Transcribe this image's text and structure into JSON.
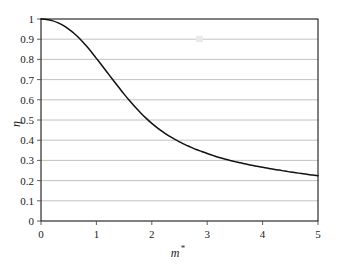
{
  "chart_data": {
    "type": "line",
    "title": "",
    "xlabel": "m*",
    "xlabel_base": "m",
    "xlabel_sup": "*",
    "ylabel": "η",
    "xlim": [
      0,
      5
    ],
    "ylim": [
      0,
      1
    ],
    "grid": "horizontal",
    "legend": "none",
    "xticks": [
      "0",
      "1",
      "2",
      "3",
      "4",
      "5"
    ],
    "xtick_values": [
      0,
      1,
      2,
      3,
      4,
      5
    ],
    "yticks": [
      "0",
      "0.1",
      "0.2",
      "0.3",
      "0.4",
      "0.5",
      "0.6",
      "0.7",
      "0.8",
      "0.9",
      "1"
    ],
    "ytick_values": [
      0,
      0.1,
      0.2,
      0.3,
      0.4,
      0.5,
      0.6,
      0.7,
      0.8,
      0.9,
      1
    ],
    "series": [
      {
        "name": "eta",
        "color": "#111111",
        "x": [
          0.0,
          0.1,
          0.2,
          0.3,
          0.4,
          0.5,
          0.6,
          0.7,
          0.8,
          0.9,
          1.0,
          1.1,
          1.2,
          1.3,
          1.4,
          1.5,
          1.6,
          1.7,
          1.8,
          1.9,
          2.0,
          2.1,
          2.2,
          2.3,
          2.4,
          2.5,
          2.6,
          2.7,
          2.8,
          2.9,
          3.0,
          3.1,
          3.2,
          3.3,
          3.4,
          3.5,
          3.6,
          3.7,
          3.8,
          3.9,
          4.0,
          4.1,
          4.2,
          4.3,
          4.4,
          4.5,
          4.6,
          4.7,
          4.8,
          4.9,
          5.0
        ],
        "y": [
          1.0,
          0.998,
          0.992,
          0.982,
          0.968,
          0.95,
          0.928,
          0.902,
          0.872,
          0.84,
          0.805,
          0.77,
          0.734,
          0.698,
          0.663,
          0.628,
          0.595,
          0.564,
          0.535,
          0.508,
          0.483,
          0.461,
          0.441,
          0.423,
          0.407,
          0.392,
          0.378,
          0.366,
          0.354,
          0.344,
          0.334,
          0.325,
          0.316,
          0.308,
          0.301,
          0.294,
          0.288,
          0.282,
          0.276,
          0.271,
          0.266,
          0.261,
          0.256,
          0.252,
          0.247,
          0.243,
          0.239,
          0.235,
          0.231,
          0.228,
          0.224
        ]
      }
    ]
  },
  "figure": {
    "plot_area": {
      "left": 41,
      "top": 19,
      "right": 318,
      "bottom": 221
    },
    "frame_color": "#000000",
    "grid_color": "#b3b3b3",
    "background": "#ffffff"
  }
}
